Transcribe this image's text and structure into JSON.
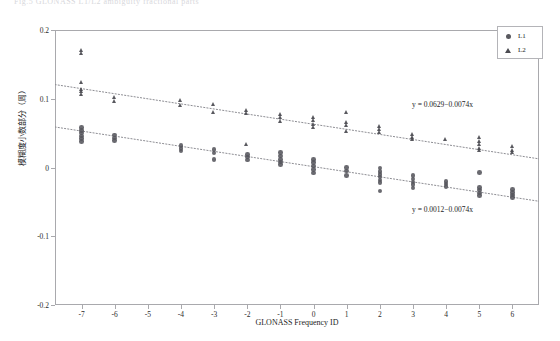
{
  "top_clipped_text": "Fig.5  GLONASS L1/L2 ambiguity fractional parts",
  "chart_data": {
    "type": "scatter",
    "title": "",
    "xlabel": "GLONASS Frequency ID",
    "ylabel": "模糊度小数部分（周）",
    "xlim": [
      -7.8,
      6.8
    ],
    "ylim": [
      -0.2,
      0.2
    ],
    "xticks": [
      -7,
      -6,
      -5,
      -4,
      -3,
      -2,
      -1,
      0,
      1,
      2,
      3,
      4,
      5,
      6
    ],
    "xticklabels": [
      "-7",
      "-6",
      "-5",
      "-4",
      "-3",
      "-2",
      "-1",
      "0",
      "1",
      "2",
      "3",
      "4",
      "5",
      "6"
    ],
    "yticks": [
      -0.2,
      -0.1,
      0,
      0.1,
      0.2
    ],
    "yticklabels": [
      "-0.2",
      "-0.1",
      "0",
      "0.1",
      "0.2"
    ],
    "grid": false,
    "legend_position": "top-right",
    "legend": [
      "L1",
      "L2"
    ],
    "series": [
      {
        "name": "L1",
        "marker": "circle",
        "color": "#55555c",
        "trendline": {
          "label": "y = 0.0012−0.0074x",
          "intercept": 0.0012,
          "slope": -0.0074,
          "style": "dotted"
        },
        "points": [
          {
            "x": -7,
            "y": 0.058
          },
          {
            "x": -7,
            "y": 0.054
          },
          {
            "x": -7,
            "y": 0.05
          },
          {
            "x": -7,
            "y": 0.046
          },
          {
            "x": -7,
            "y": 0.042
          },
          {
            "x": -7,
            "y": 0.038
          },
          {
            "x": -6,
            "y": 0.047
          },
          {
            "x": -6,
            "y": 0.043
          },
          {
            "x": -6,
            "y": 0.039
          },
          {
            "x": -4,
            "y": 0.032
          },
          {
            "x": -4,
            "y": 0.028
          },
          {
            "x": -4,
            "y": 0.024
          },
          {
            "x": -3,
            "y": 0.026
          },
          {
            "x": -3,
            "y": 0.021
          },
          {
            "x": -3,
            "y": 0.012
          },
          {
            "x": -2,
            "y": 0.019
          },
          {
            "x": -2,
            "y": 0.015
          },
          {
            "x": -2,
            "y": 0.011
          },
          {
            "x": -1,
            "y": 0.022
          },
          {
            "x": -1,
            "y": 0.017
          },
          {
            "x": -1,
            "y": 0.012
          },
          {
            "x": -1,
            "y": 0.008
          },
          {
            "x": -1,
            "y": 0.004
          },
          {
            "x": 0,
            "y": 0.012
          },
          {
            "x": 0,
            "y": 0.007
          },
          {
            "x": 0,
            "y": 0.002
          },
          {
            "x": 0,
            "y": -0.003
          },
          {
            "x": 0,
            "y": -0.008
          },
          {
            "x": 1,
            "y": 0.0
          },
          {
            "x": 1,
            "y": -0.005
          },
          {
            "x": 1,
            "y": -0.012
          },
          {
            "x": 2,
            "y": -0.001
          },
          {
            "x": 2,
            "y": -0.006
          },
          {
            "x": 2,
            "y": -0.01
          },
          {
            "x": 2,
            "y": -0.014
          },
          {
            "x": 2,
            "y": -0.018
          },
          {
            "x": 2,
            "y": -0.022
          },
          {
            "x": 2,
            "y": -0.034
          },
          {
            "x": 3,
            "y": -0.012
          },
          {
            "x": 3,
            "y": -0.017
          },
          {
            "x": 3,
            "y": -0.021
          },
          {
            "x": 3,
            "y": -0.025
          },
          {
            "x": 3,
            "y": -0.03
          },
          {
            "x": 4,
            "y": -0.02
          },
          {
            "x": 4,
            "y": -0.024
          },
          {
            "x": 4,
            "y": -0.028
          },
          {
            "x": 5,
            "y": -0.007
          },
          {
            "x": 5,
            "y": -0.029
          },
          {
            "x": 5,
            "y": -0.033
          },
          {
            "x": 5,
            "y": -0.037
          },
          {
            "x": 5,
            "y": -0.041
          },
          {
            "x": 6,
            "y": -0.032
          },
          {
            "x": 6,
            "y": -0.036
          },
          {
            "x": 6,
            "y": -0.04
          },
          {
            "x": 6,
            "y": -0.044
          }
        ]
      },
      {
        "name": "L2",
        "marker": "triangle",
        "color": "#47474e",
        "trendline": {
          "label": "y = 0.0629−0.0074x",
          "intercept": 0.0629,
          "slope": -0.0074,
          "style": "dotted"
        },
        "points": [
          {
            "x": -7,
            "y": 0.17
          },
          {
            "x": -7,
            "y": 0.166
          },
          {
            "x": -7,
            "y": 0.124
          },
          {
            "x": -7,
            "y": 0.114
          },
          {
            "x": -7,
            "y": 0.11
          },
          {
            "x": -7,
            "y": 0.106
          },
          {
            "x": -6,
            "y": 0.101
          },
          {
            "x": -6,
            "y": 0.096
          },
          {
            "x": -4,
            "y": 0.097
          },
          {
            "x": -4,
            "y": 0.09
          },
          {
            "x": -3,
            "y": 0.091
          },
          {
            "x": -3,
            "y": 0.08
          },
          {
            "x": -2,
            "y": 0.083
          },
          {
            "x": -2,
            "y": 0.078
          },
          {
            "x": -2,
            "y": 0.034
          },
          {
            "x": -1,
            "y": 0.077
          },
          {
            "x": -1,
            "y": 0.072
          },
          {
            "x": -1,
            "y": 0.067
          },
          {
            "x": 0,
            "y": 0.073
          },
          {
            "x": 0,
            "y": 0.068
          },
          {
            "x": 0,
            "y": 0.063
          },
          {
            "x": 0,
            "y": 0.058
          },
          {
            "x": 1,
            "y": 0.08
          },
          {
            "x": 1,
            "y": 0.065
          },
          {
            "x": 1,
            "y": 0.061
          },
          {
            "x": 1,
            "y": 0.052
          },
          {
            "x": 2,
            "y": 0.059
          },
          {
            "x": 2,
            "y": 0.055
          },
          {
            "x": 2,
            "y": 0.051
          },
          {
            "x": 3,
            "y": 0.048
          },
          {
            "x": 3,
            "y": 0.044
          },
          {
            "x": 3,
            "y": 0.04
          },
          {
            "x": 4,
            "y": 0.04
          },
          {
            "x": 5,
            "y": 0.043
          },
          {
            "x": 5,
            "y": 0.038
          },
          {
            "x": 5,
            "y": 0.033
          },
          {
            "x": 5,
            "y": 0.028
          },
          {
            "x": 5,
            "y": 0.024
          },
          {
            "x": 6,
            "y": 0.03
          },
          {
            "x": 6,
            "y": 0.025
          },
          {
            "x": 6,
            "y": 0.021
          }
        ]
      }
    ]
  }
}
